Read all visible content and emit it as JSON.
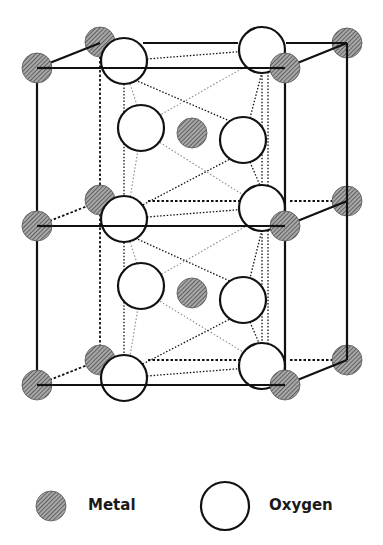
{
  "colors": {
    "background": "#ffffff",
    "stroke": "#111111",
    "metal_fill": "#9a9a9a",
    "hatch": "#3a3a3a",
    "light_dotted": "#8a8a8a"
  },
  "legend": {
    "metal": {
      "label": "Metal",
      "cx": 51,
      "cy": 506,
      "r": 15,
      "text_x": 88,
      "text_y": 498
    },
    "oxygen": {
      "label": "Oxygen",
      "cx": 225,
      "cy": 506,
      "r": 24,
      "text_x": 269,
      "text_y": 498
    }
  },
  "structure": {
    "metal_r": 15,
    "oxygen_r": 23,
    "solid_lines": [
      [
        37,
        68,
        285,
        68
      ],
      [
        37,
        68,
        37,
        385
      ],
      [
        285,
        68,
        285,
        385
      ],
      [
        37,
        226,
        285,
        226
      ],
      [
        37,
        385,
        285,
        385
      ],
      [
        37,
        68,
        100,
        43
      ],
      [
        285,
        68,
        347,
        43
      ],
      [
        285,
        226,
        347,
        201
      ],
      [
        285,
        385,
        347,
        360
      ],
      [
        143,
        43,
        238,
        43
      ],
      [
        286,
        43,
        347,
        43
      ],
      [
        347,
        43,
        347,
        360
      ]
    ],
    "dashed_lines": [
      [
        100,
        43,
        100,
        360
      ],
      [
        37,
        226,
        100,
        201
      ],
      [
        37,
        385,
        100,
        360
      ],
      [
        148,
        201,
        240,
        201
      ],
      [
        290,
        201,
        347,
        201
      ],
      [
        148,
        360,
        240,
        360
      ],
      [
        290,
        360,
        347,
        360
      ]
    ],
    "dotted_dark": [
      [
        147,
        59,
        248,
        51
      ],
      [
        147,
        217,
        248,
        209
      ],
      [
        147,
        376,
        248,
        368
      ],
      [
        124,
        61,
        124,
        378
      ],
      [
        262,
        72,
        262,
        366
      ],
      [
        268,
        72,
        268,
        366
      ],
      [
        135,
        80,
        232,
        122
      ],
      [
        232,
        158,
        135,
        209
      ],
      [
        135,
        238,
        232,
        282
      ],
      [
        232,
        318,
        135,
        368
      ],
      [
        262,
        72,
        250,
        118
      ],
      [
        250,
        162,
        262,
        190
      ],
      [
        262,
        230,
        250,
        278
      ],
      [
        250,
        322,
        262,
        350
      ]
    ],
    "dotted_light": [
      [
        248,
        65,
        148,
        122
      ],
      [
        148,
        135,
        248,
        198
      ],
      [
        248,
        225,
        148,
        282
      ],
      [
        148,
        294,
        248,
        355
      ],
      [
        130,
        84,
        138,
        108
      ],
      [
        138,
        150,
        130,
        198
      ],
      [
        130,
        242,
        138,
        266
      ],
      [
        138,
        308,
        130,
        356
      ]
    ],
    "metals": [
      {
        "id": "metal-back-top-left",
        "cx": 100,
        "cy": 42
      },
      {
        "id": "metal-back-top-right",
        "cx": 347,
        "cy": 43
      },
      {
        "id": "metal-back-mid-left",
        "cx": 100,
        "cy": 200
      },
      {
        "id": "metal-back-mid-right",
        "cx": 347,
        "cy": 201
      },
      {
        "id": "metal-back-bottom-left",
        "cx": 100,
        "cy": 360
      },
      {
        "id": "metal-back-bottom-right",
        "cx": 347,
        "cy": 360
      },
      {
        "id": "metal-center-upper",
        "cx": 192,
        "cy": 133
      },
      {
        "id": "metal-center-lower",
        "cx": 192,
        "cy": 293
      }
    ],
    "oxygens": [
      {
        "id": "oxygen-top-back-right",
        "cx": 262,
        "cy": 50
      },
      {
        "id": "oxygen-mid-back-right",
        "cx": 262,
        "cy": 208
      },
      {
        "id": "oxygen-bottom-back-right",
        "cx": 262,
        "cy": 366
      },
      {
        "id": "oxygen-upper-inner-left",
        "cx": 141,
        "cy": 128
      },
      {
        "id": "oxygen-upper-inner-right",
        "cx": 243,
        "cy": 140
      },
      {
        "id": "oxygen-lower-inner-left",
        "cx": 141,
        "cy": 286
      },
      {
        "id": "oxygen-lower-inner-right",
        "cx": 243,
        "cy": 300
      },
      {
        "id": "oxygen-top-front-left",
        "cx": 124,
        "cy": 61
      },
      {
        "id": "oxygen-mid-front-left",
        "cx": 124,
        "cy": 219
      },
      {
        "id": "oxygen-bottom-front-left",
        "cx": 124,
        "cy": 378
      }
    ],
    "front_metals": [
      {
        "id": "metal-front-top-left",
        "cx": 37,
        "cy": 68
      },
      {
        "id": "metal-front-top-right",
        "cx": 285,
        "cy": 68
      },
      {
        "id": "metal-front-mid-left",
        "cx": 37,
        "cy": 226
      },
      {
        "id": "metal-front-mid-right",
        "cx": 285,
        "cy": 226
      },
      {
        "id": "metal-front-bottom-left",
        "cx": 37,
        "cy": 385
      },
      {
        "id": "metal-front-bottom-right",
        "cx": 285,
        "cy": 385
      }
    ]
  }
}
